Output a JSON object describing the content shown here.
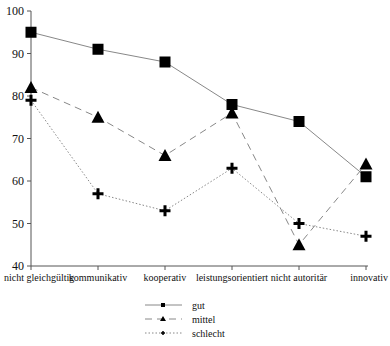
{
  "chart_data": {
    "type": "line",
    "title": "",
    "xlabel": "",
    "ylabel": "",
    "ylim": [
      40,
      100
    ],
    "yticks": [
      40,
      50,
      60,
      70,
      80,
      90,
      100
    ],
    "grid": false,
    "legend_position": "bottom",
    "categories": [
      "nicht gleichgültig",
      "kommunikativ",
      "kooperativ",
      "leistungsorientiert",
      "nicht autoritär",
      "innovativ"
    ],
    "series": [
      {
        "name": "gut",
        "marker": "square",
        "line": "solid",
        "values": [
          95,
          91,
          88,
          78,
          74,
          61
        ]
      },
      {
        "name": "mittel",
        "marker": "triangle",
        "line": "dashed",
        "values": [
          82,
          75,
          66,
          76,
          45,
          64
        ]
      },
      {
        "name": "schlecht",
        "marker": "plus",
        "line": "dotted",
        "values": [
          79,
          57,
          53,
          63,
          50,
          47
        ]
      }
    ]
  },
  "colors": {
    "line": "#888888",
    "marker": "#000000",
    "axis": "#555555"
  }
}
